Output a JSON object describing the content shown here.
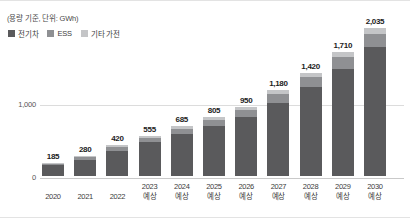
{
  "note": "(용량 기준, 단위: GWh)",
  "legend": [
    {
      "label": "전기차",
      "color": "#5a5a5c",
      "key": "ev"
    },
    {
      "label": "ESS",
      "color": "#8f9093",
      "key": "ess"
    },
    {
      "label": "기타 가전",
      "color": "#c4c5c7",
      "key": "etc"
    }
  ],
  "forecast_suffix": "예상",
  "chart_data": {
    "type": "bar",
    "stacked": true,
    "title": "",
    "subtitle": "(용량 기준, 단위: GWh)",
    "xlabel": "",
    "ylabel": "",
    "unit": "GWh",
    "ylim": [
      0,
      2200
    ],
    "grid": true,
    "legend_position": "top-left",
    "ytick_labels": [
      "0",
      "1,000"
    ],
    "ytick_values": [
      0,
      1000
    ],
    "categories": [
      "2020",
      "2021",
      "2022",
      "2023",
      "2024",
      "2025",
      "2026",
      "2027",
      "2028",
      "2029",
      "2030"
    ],
    "category_notes": [
      "",
      "",
      "",
      "예상",
      "예상",
      "예상",
      "예상",
      "예상",
      "예상",
      "예상",
      "예상"
    ],
    "totals": [
      185,
      280,
      420,
      555,
      685,
      805,
      950,
      1180,
      1420,
      1710,
      2035
    ],
    "total_labels": [
      "185",
      "280",
      "420",
      "555",
      "685",
      "805",
      "950",
      "1,180",
      "1,420",
      "1,710",
      "2,035"
    ],
    "series": [
      {
        "name": "전기차",
        "key": "ev",
        "color": "#5a5a5c",
        "values": [
          148,
          227,
          345,
          461,
          575,
          681,
          808,
          1009,
          1221,
          1478,
          1770
        ]
      },
      {
        "name": "ESS",
        "key": "ess",
        "color": "#8f9093",
        "values": [
          24,
          35,
          50,
          63,
          75,
          86,
          99,
          119,
          138,
          162,
          187
        ]
      },
      {
        "name": "기타 가전",
        "key": "etc",
        "color": "#c4c5c7",
        "values": [
          13,
          18,
          25,
          31,
          35,
          38,
          43,
          52,
          61,
          70,
          78
        ]
      }
    ]
  }
}
